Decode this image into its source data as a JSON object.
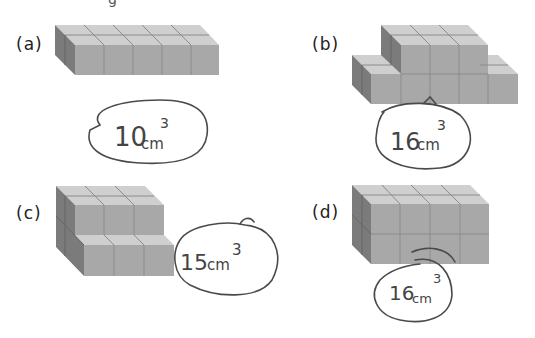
{
  "page": {
    "partial_header_text": "g"
  },
  "problems": [
    {
      "label": "(a)",
      "cubes": 10,
      "answer_number": "10",
      "answer_unit": "cm",
      "answer_exp": "3"
    },
    {
      "label": "(b)",
      "cubes": 16,
      "answer_number": "16",
      "answer_unit": "cm",
      "answer_exp": "3"
    },
    {
      "label": "(c)",
      "cubes": 15,
      "answer_number": "15",
      "answer_unit": "cm",
      "answer_exp": "3"
    },
    {
      "label": "(d)",
      "cubes": 16,
      "answer_number": "16",
      "answer_unit": "cm",
      "answer_exp": "3"
    }
  ],
  "colors": {
    "top_face": "#cfcfcf",
    "front_face": "#a9a9a9",
    "side_face": "#7c7c7c",
    "grid_line": "#8a8a8a",
    "ink": "#4a4a4a"
  }
}
